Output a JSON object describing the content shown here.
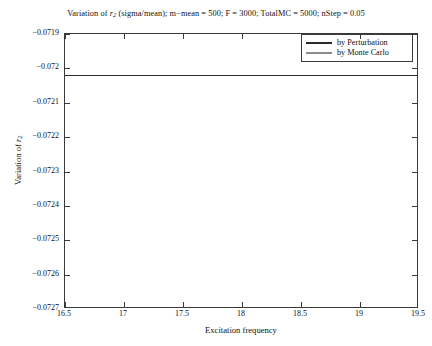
{
  "chart_data": {
    "type": "line",
    "title_parts": {
      "prefix": "Variation of ",
      "var_base": "r",
      "var_sub": "2",
      "suffix": " (sigma/mean); m−mean = 500; F = 3000; TotalMC = 5000; nStep = 0.05"
    },
    "xlabel": "Excitation frequency",
    "ylabel": "Variation of r2",
    "ylabel_parts": {
      "prefix": "Variation of ",
      "var_base": "r",
      "var_sub": "2"
    },
    "xlim": [
      16.5,
      19.5
    ],
    "ylim": [
      -0.0727,
      -0.0719
    ],
    "xticks": [
      16.5,
      17,
      17.5,
      18,
      18.5,
      19,
      19.5
    ],
    "xtick_labels": [
      "16.5",
      "17",
      "17.5",
      "18",
      "18.5",
      "19",
      "19.5"
    ],
    "yticks": [
      -0.0727,
      -0.0726,
      -0.0725,
      -0.0724,
      -0.0723,
      -0.0722,
      -0.0721,
      -0.072,
      -0.0719
    ],
    "ytick_labels": [
      "−0.0727",
      "−0.0726",
      "−0.0725",
      "−0.0724",
      "−0.0723",
      "−0.0722",
      "−0.0721",
      "−0.072",
      "−0.0719"
    ],
    "grid": false,
    "legend_position": "top-right",
    "series": [
      {
        "name": "by Perturbation",
        "color": "#2b2b2b",
        "x": [
          16.5,
          19.5
        ],
        "values": [
          -0.07202,
          -0.07202
        ]
      },
      {
        "name": "by Monte Carlo",
        "color": "#8c8c8c",
        "x": [
          16.5,
          19.5
        ],
        "values": [
          -0.07202,
          -0.07202
        ]
      }
    ]
  },
  "legend": {
    "items": [
      {
        "label": "by Perturbation"
      },
      {
        "label": "by Monte Carlo"
      }
    ]
  }
}
